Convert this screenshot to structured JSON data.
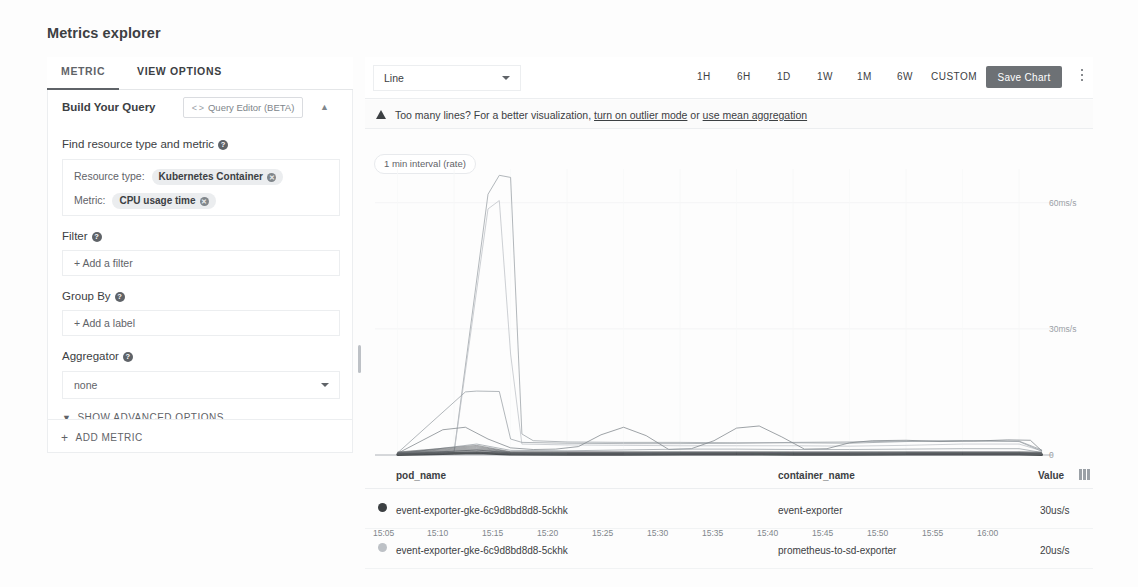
{
  "page": {
    "title": "Metrics explorer"
  },
  "left_panel": {
    "tabs": [
      {
        "label": "METRIC",
        "active": true
      },
      {
        "label": "VIEW OPTIONS",
        "active": false
      }
    ],
    "card": {
      "title": "Build Your Query",
      "query_editor_label": "Query Editor (BETA)",
      "query_editor_icon": "code-brackets-icon",
      "collapse_icon": "chevron-up-icon"
    },
    "sections": {
      "find_resource": {
        "label": "Find resource type and metric",
        "help_icon": "help-circle-icon",
        "resource_type_label": "Resource type:",
        "resource_type_value": "Kubernetes Container",
        "metric_label": "Metric:",
        "metric_value": "CPU usage time",
        "remove_icon": "remove-circle-icon"
      },
      "filter": {
        "label": "Filter",
        "help_icon": "help-circle-icon",
        "placeholder": "+ Add a filter"
      },
      "group_by": {
        "label": "Group By",
        "help_icon": "help-circle-icon",
        "placeholder": "+ Add a label"
      },
      "aggregator": {
        "label": "Aggregator",
        "help_icon": "help-circle-icon",
        "value": "none",
        "caret_icon": "chevron-down-icon",
        "options": [
          "none",
          "sum",
          "mean",
          "min",
          "max",
          "count"
        ]
      }
    },
    "show_advanced_options": "SHOW ADVANCED OPTIONS",
    "add_metric": "ADD METRIC"
  },
  "chart_panel": {
    "viz_type": "Line",
    "viz_type_options": [
      "Line",
      "Stacked bar",
      "Stacked area",
      "Heatmap"
    ],
    "viz_caret_icon": "chevron-down-icon",
    "time_ranges": [
      "1H",
      "6H",
      "1D",
      "1W",
      "1M",
      "6W",
      "CUSTOM"
    ],
    "save_chart": "Save Chart",
    "kebab_icon": "more-vert-icon",
    "warning": {
      "icon": "warning-triangle-icon",
      "text_before": "Too many lines? For a better visualization,",
      "link1": "turn on outlier mode",
      "text_middle": "or",
      "link2": "use mean aggregation"
    },
    "interval_chip": "1 min interval (rate)"
  },
  "chart_data": {
    "type": "line",
    "title": "",
    "xlabel": "",
    "ylabel": "",
    "unit": "ms/s",
    "grid": true,
    "legend_position": "below-table",
    "x_ticks": [
      "15:05",
      "15:10",
      "15:15",
      "15:20",
      "15:25",
      "15:30",
      "15:35",
      "15:40",
      "15:45",
      "15:50",
      "15:55",
      "16:00"
    ],
    "y_ticks": [
      "0",
      "30ms/s",
      "60ms/s"
    ],
    "ylim": [
      0,
      68
    ],
    "xlim": [
      "15:03",
      "16:03"
    ],
    "series": [
      {
        "name": "spike-line-a",
        "color": "#9aa0a6",
        "x": [
          "15:05",
          "15:10",
          "15:13",
          "15:14",
          "15:15",
          "15:16",
          "15:17",
          "15:20",
          "15:25",
          "15:30",
          "15:35",
          "15:40",
          "15:45",
          "15:50",
          "15:55",
          "16:00",
          "16:02"
        ],
        "values": [
          0.6,
          0.8,
          62.0,
          66.5,
          66.0,
          5.0,
          3.4,
          3.1,
          3.0,
          3.0,
          2.9,
          2.9,
          2.8,
          3.2,
          3.4,
          3.3,
          1.2
        ]
      },
      {
        "name": "spike-line-b",
        "color": "#bdc1c6",
        "x": [
          "15:05",
          "15:10",
          "15:13",
          "15:14",
          "15:15",
          "15:16",
          "15:20",
          "15:25",
          "15:30",
          "15:35",
          "15:40",
          "15:45",
          "15:50",
          "15:55",
          "16:00",
          "16:02"
        ],
        "values": [
          0.4,
          0.6,
          58.5,
          60.5,
          24.0,
          2.6,
          2.4,
          2.3,
          2.2,
          2.2,
          2.2,
          2.1,
          2.3,
          2.6,
          2.6,
          1.0
        ]
      },
      {
        "name": "plateau-line",
        "color": "#9aa0a6",
        "x": [
          "15:05",
          "15:11",
          "15:12",
          "15:14",
          "15:15",
          "15:16",
          "15:20",
          "15:25",
          "15:30",
          "15:35",
          "15:40",
          "15:45",
          "15:50",
          "15:55",
          "16:00",
          "16:02"
        ],
        "values": [
          0.5,
          15.0,
          15.2,
          15.1,
          3.8,
          3.0,
          2.8,
          2.7,
          2.7,
          2.8,
          3.0,
          3.1,
          3.3,
          3.4,
          3.2,
          0.9
        ]
      },
      {
        "name": "oscillating-line",
        "color": "#80868b",
        "x": [
          "15:05",
          "15:09",
          "15:11",
          "15:13",
          "15:15",
          "15:17",
          "15:19",
          "15:21",
          "15:23",
          "15:25",
          "15:27",
          "15:29",
          "15:31",
          "15:33",
          "15:35",
          "15:37",
          "15:39",
          "15:41",
          "15:43",
          "15:45",
          "15:47",
          "15:50",
          "15:53",
          "15:56",
          "15:59",
          "16:01",
          "16:02"
        ],
        "values": [
          0.4,
          6.0,
          6.6,
          3.8,
          1.7,
          1.3,
          1.4,
          2.0,
          4.8,
          6.6,
          4.6,
          1.3,
          1.5,
          3.4,
          6.4,
          6.9,
          4.3,
          1.4,
          1.5,
          2.9,
          3.4,
          3.5,
          3.2,
          3.3,
          3.6,
          3.5,
          1.0
        ]
      },
      {
        "name": "low-flat-line-1",
        "color": "#9aa0a6",
        "x": [
          "15:05",
          "15:12",
          "15:15",
          "15:20",
          "15:25",
          "15:30",
          "15:35",
          "15:40",
          "15:45",
          "15:50",
          "15:55",
          "16:00",
          "16:02"
        ],
        "values": [
          0.3,
          2.6,
          1.1,
          1.0,
          1.2,
          1.4,
          1.4,
          1.3,
          1.3,
          1.4,
          1.5,
          1.5,
          0.6
        ]
      },
      {
        "name": "low-flat-line-2",
        "color": "#5f6368",
        "x": [
          "15:05",
          "15:12",
          "15:15",
          "15:20",
          "15:25",
          "15:30",
          "15:35",
          "15:40",
          "15:45",
          "15:50",
          "15:55",
          "16:00",
          "16:02"
        ],
        "values": [
          0.2,
          1.2,
          0.5,
          0.45,
          0.45,
          0.5,
          0.5,
          0.45,
          0.45,
          0.5,
          0.5,
          0.5,
          0.25
        ]
      },
      {
        "name": "baseline-bundle",
        "color": "#3c4043",
        "x": [
          "15:05",
          "15:12",
          "15:15",
          "15:20",
          "15:25",
          "15:30",
          "15:35",
          "15:40",
          "15:45",
          "15:50",
          "15:55",
          "16:00",
          "16:02"
        ],
        "values": [
          0.1,
          0.5,
          0.18,
          0.16,
          0.16,
          0.17,
          0.17,
          0.16,
          0.16,
          0.17,
          0.17,
          0.17,
          0.08
        ]
      }
    ]
  },
  "legend_table": {
    "columns": [
      "pod_name",
      "container_name",
      "Value"
    ],
    "columns_icon": "columns-icon",
    "rows": [
      {
        "swatch_color": "#3c4043",
        "pod_name": "event-exporter-gke-6c9d8bd8d8-5ckhk",
        "container_name": "event-exporter",
        "value": "30us/s"
      },
      {
        "swatch_color": "#bdc1c6",
        "pod_name": "event-exporter-gke-6c9d8bd8d8-5ckhk",
        "container_name": "prometheus-to-sd-exporter",
        "value": "20us/s"
      }
    ]
  }
}
